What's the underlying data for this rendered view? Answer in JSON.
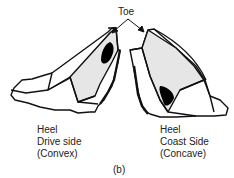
{
  "figure": {
    "toe_label": "Toe",
    "caption": "(b)",
    "colors": {
      "outline": "#111111",
      "face_shade": "#e6e6e6",
      "contact_pattern": "#000000",
      "background": "#ffffff"
    },
    "left_tooth": {
      "line1": "Heel",
      "line2": "Drive side",
      "line3": "(Convex)"
    },
    "right_tooth": {
      "line1": "Heel",
      "line2": "Coast Side",
      "line3": "(Concave)"
    }
  }
}
